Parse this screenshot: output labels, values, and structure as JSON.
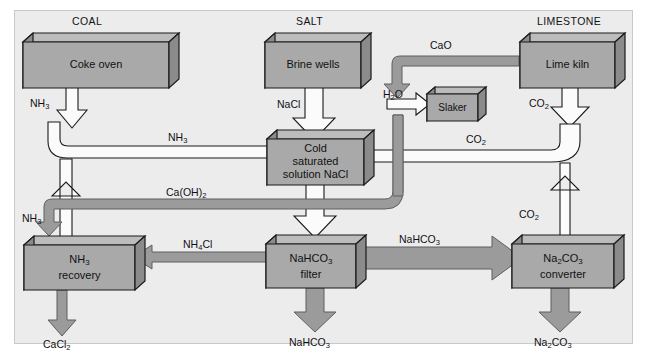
{
  "diagram": {
    "colors": {
      "panel_bg": "#ececed",
      "box_face": "#a8a8a8",
      "box_top": "#b9b9b9",
      "box_side": "#8d8d8d",
      "box_stroke": "#1a1a1a",
      "white_arrow_fill": "#fbfbfb",
      "white_arrow_stroke": "#1a1a1a",
      "gray_arrow_fill": "#9b9b9b",
      "gray_arrow_stroke": "#5a5a5a"
    },
    "headers": [
      {
        "id": "coal",
        "label": "COAL"
      },
      {
        "id": "salt",
        "label": "SALT"
      },
      {
        "id": "limestone",
        "label": "LIMESTONE"
      }
    ],
    "nodes": [
      {
        "id": "coke-oven",
        "line1": "Coke oven",
        "line2": ""
      },
      {
        "id": "brine-wells",
        "line1": "Brine wells",
        "line2": ""
      },
      {
        "id": "lime-kiln",
        "line1": "Lime kiln",
        "line2": ""
      },
      {
        "id": "slaker",
        "line1": "Slaker",
        "line2": ""
      },
      {
        "id": "cold-solution",
        "line1": "Cold",
        "line2": "saturated",
        "line3": "solution  NaCl"
      },
      {
        "id": "nh3-recovery",
        "line1": "NH3",
        "line2": "recovery"
      },
      {
        "id": "nahco3-filter",
        "line1": "NaHCO3",
        "line2": "filter"
      },
      {
        "id": "na2co3-converter",
        "line1": "Na2CO3",
        "line2": "converter"
      }
    ],
    "flows": [
      {
        "id": "nh3-from-coke",
        "label": "NH3",
        "style": "white"
      },
      {
        "id": "nh3-to-solution",
        "label": "NH3",
        "style": "white"
      },
      {
        "id": "nacl-from-brine",
        "label": "NaCl",
        "style": "white"
      },
      {
        "id": "cao-from-kiln",
        "label": "CaO",
        "style": "gray"
      },
      {
        "id": "h2o-to-slaker",
        "label": "H2O",
        "style": "white"
      },
      {
        "id": "co2-from-kiln",
        "label": "CO2",
        "style": "white"
      },
      {
        "id": "co2-to-solution",
        "label": "CO2",
        "style": "white"
      },
      {
        "id": "co2-from-converter",
        "label": "CO2",
        "style": "white"
      },
      {
        "id": "caoh2-from-slaker",
        "label": "Ca(OH)2",
        "style": "gray"
      },
      {
        "id": "nh3-recovered",
        "label": "NH3",
        "style": "white"
      },
      {
        "id": "nh4cl-to-recovery",
        "label": "NH4Cl",
        "style": "gray"
      },
      {
        "id": "nahco3-to-converter",
        "label": "NaHCO3",
        "style": "gray"
      }
    ],
    "products": [
      {
        "id": "cacl2",
        "label": "CaCl2"
      },
      {
        "id": "nahco3",
        "label": "NaHCO3"
      },
      {
        "id": "na2co3",
        "label": "Na2CO3"
      }
    ]
  }
}
